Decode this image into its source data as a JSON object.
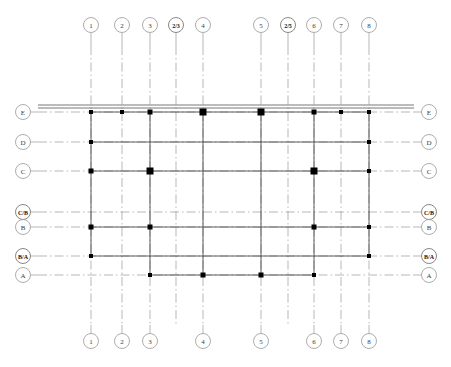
{
  "drawing": {
    "title": "Structural Column Grid Plan",
    "type": "column-grid-plan",
    "canvas": {
      "width": 451,
      "height": 367
    },
    "colors": {
      "background": "#ffffff",
      "gridline": "#9a9a9a",
      "beam": "#4a4a4a",
      "column": "#000000",
      "bubble_stroke": "#8a8a8a",
      "bubble_text": "#3a3a3a"
    }
  },
  "columns": [
    {
      "label": "1",
      "x": 91,
      "fraction": false,
      "bubble_top": true,
      "bubble_bottom": true
    },
    {
      "label": "2",
      "x": 122,
      "fraction": false,
      "bubble_top": true,
      "bubble_bottom": true
    },
    {
      "label": "3",
      "x": 150,
      "fraction": false,
      "bubble_top": true,
      "bubble_bottom": true
    },
    {
      "label": "2/3",
      "x": 176,
      "fraction": true,
      "bubble_top": true,
      "bubble_bottom": false
    },
    {
      "label": "4",
      "x": 203,
      "fraction": false,
      "bubble_top": true,
      "bubble_bottom": true
    },
    {
      "label": "5",
      "x": 261,
      "fraction": false,
      "bubble_top": true,
      "bubble_bottom": true
    },
    {
      "label": "2/5",
      "x": 288,
      "fraction": true,
      "bubble_top": true,
      "bubble_bottom": false
    },
    {
      "label": "6",
      "x": 314,
      "fraction": false,
      "bubble_top": true,
      "bubble_bottom": true
    },
    {
      "label": "7",
      "x": 341,
      "fraction": false,
      "bubble_top": true,
      "bubble_bottom": true
    },
    {
      "label": "8",
      "x": 369,
      "fraction": false,
      "bubble_top": true,
      "bubble_bottom": true
    }
  ],
  "rows": [
    {
      "label": "E",
      "y": 112,
      "fraction": false,
      "style": "double-wall",
      "bubble_left": true,
      "bubble_right": true
    },
    {
      "label": "D",
      "y": 142,
      "fraction": false,
      "style": "single",
      "bubble_left": true,
      "bubble_right": true
    },
    {
      "label": "C",
      "y": 171,
      "fraction": false,
      "style": "single",
      "bubble_left": true,
      "bubble_right": true
    },
    {
      "label": "C/B",
      "y": 212,
      "fraction": true,
      "style": "single",
      "bubble_left": true,
      "bubble_right": true
    },
    {
      "label": "B",
      "y": 227,
      "fraction": false,
      "style": "single",
      "bubble_left": true,
      "bubble_right": true
    },
    {
      "label": "B/A",
      "y": 256,
      "fraction": true,
      "style": "single",
      "bubble_left": true,
      "bubble_right": true
    },
    {
      "label": "A",
      "y": 275,
      "fraction": false,
      "style": "single",
      "bubble_left": true,
      "bubble_right": true
    }
  ],
  "column_markers": [
    {
      "row": "E",
      "col": "1",
      "size": 4
    },
    {
      "row": "E",
      "col": "2",
      "size": 4
    },
    {
      "row": "E",
      "col": "3",
      "size": 5
    },
    {
      "row": "E",
      "col": "4",
      "size": 7
    },
    {
      "row": "E",
      "col": "5",
      "size": 7
    },
    {
      "row": "E",
      "col": "6",
      "size": 5
    },
    {
      "row": "E",
      "col": "7",
      "size": 4
    },
    {
      "row": "E",
      "col": "8",
      "size": 4
    },
    {
      "row": "D",
      "col": "1",
      "size": 4
    },
    {
      "row": "D",
      "col": "8",
      "size": 4
    },
    {
      "row": "C",
      "col": "1",
      "size": 5
    },
    {
      "row": "C",
      "col": "3",
      "size": 7
    },
    {
      "row": "C",
      "col": "6",
      "size": 7
    },
    {
      "row": "C",
      "col": "8",
      "size": 4
    },
    {
      "row": "B",
      "col": "1",
      "size": 5
    },
    {
      "row": "B",
      "col": "3",
      "size": 5
    },
    {
      "row": "B",
      "col": "6",
      "size": 5
    },
    {
      "row": "B",
      "col": "8",
      "size": 4
    },
    {
      "row": "B/A",
      "col": "1",
      "size": 4
    },
    {
      "row": "B/A",
      "col": "8",
      "size": 4
    },
    {
      "row": "A",
      "col": "3",
      "size": 4
    },
    {
      "row": "A",
      "col": "4",
      "size": 5
    },
    {
      "row": "A",
      "col": "5",
      "size": 5
    },
    {
      "row": "A",
      "col": "6",
      "size": 4
    }
  ],
  "extents": {
    "grid_left": 38,
    "grid_right": 414,
    "grid_top": 46,
    "grid_bottom": 325,
    "bubble_top_y": 25,
    "bubble_bottom_y": 341,
    "bubble_left_x": 23,
    "bubble_right_x": 429,
    "bubble_radius": 7.5
  }
}
